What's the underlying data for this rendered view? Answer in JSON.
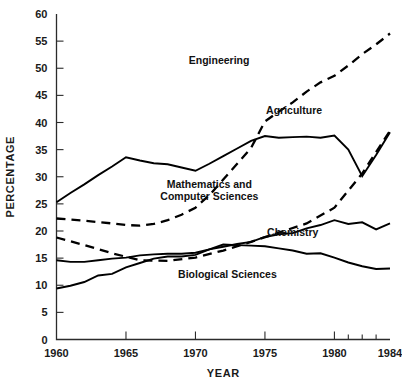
{
  "chart_data": {
    "type": "line",
    "title": "",
    "subtitle": "",
    "xlabel": "YEAR",
    "ylabel": "PERCENTAGE",
    "xlim": [
      1960,
      1984
    ],
    "ylim": [
      0,
      60
    ],
    "ytick_step": 5,
    "grid": false,
    "legend_position": "inline-labels",
    "y_ticks": [
      0,
      5,
      10,
      15,
      20,
      25,
      30,
      35,
      40,
      45,
      50,
      55,
      60
    ],
    "y_tick_labels": [
      "0",
      "5",
      "10",
      "15",
      "20",
      "25",
      "30",
      "35",
      "40",
      "45",
      "50",
      "55",
      "60"
    ],
    "x_ticks_major": [
      1960,
      1965,
      1970,
      1975,
      1980,
      1984
    ],
    "x_tick_labels": [
      "1960",
      "1965",
      "1970",
      "1975",
      "1980",
      "1984"
    ],
    "x_ticks_minor": [
      1981,
      1982,
      1983
    ],
    "series": [
      {
        "name": "Agriculture",
        "style": "solid",
        "color": "#000000",
        "label_x": 1977.1,
        "label_y": 41.5,
        "x": [
          1960,
          1961,
          1962,
          1963,
          1964,
          1965,
          1966,
          1967,
          1968,
          1969,
          1970,
          1971,
          1972,
          1973,
          1974,
          1975,
          1976,
          1977,
          1978,
          1979,
          1980,
          1981,
          1982,
          1983,
          1984
        ],
        "values": [
          25.3,
          27.0,
          28.6,
          30.3,
          31.9,
          33.6,
          33.0,
          32.5,
          32.3,
          31.7,
          31.1,
          32.4,
          33.8,
          35.2,
          36.6,
          37.5,
          37.2,
          37.3,
          37.4,
          37.2,
          37.6,
          35.0,
          30.1,
          34.0,
          38.2
        ]
      },
      {
        "name": "Engineering",
        "style": "dashed",
        "color": "#000000",
        "label_x": 1971.7,
        "label_y": 50.8,
        "x": [
          1960,
          1962,
          1964,
          1965,
          1966,
          1967,
          1968,
          1969,
          1970,
          1971,
          1972,
          1973,
          1974,
          1975,
          1976,
          1977,
          1978,
          1979,
          1980,
          1981,
          1982,
          1983,
          1984
        ],
        "values": [
          22.3,
          21.9,
          21.4,
          21.1,
          21.0,
          21.3,
          22.0,
          23.0,
          24.3,
          26.6,
          29.5,
          32.4,
          35.3,
          40.2,
          42.0,
          43.7,
          45.7,
          47.4,
          48.6,
          50.5,
          52.6,
          54.4,
          56.4
        ]
      },
      {
        "name": "Mathematics and Computer Sciences",
        "style": "dashed",
        "color": "#000000",
        "label_x": 1971.0,
        "label_y": 28.0,
        "label_line_2": "Computer Sciences",
        "x": [
          1960,
          1962,
          1964,
          1966,
          1968,
          1970,
          1972,
          1974,
          1976,
          1978,
          1980,
          1982,
          1984
        ],
        "values": [
          18.8,
          17.4,
          15.9,
          14.6,
          14.5,
          15.1,
          16.4,
          18.0,
          19.7,
          21.4,
          24.3,
          30.6,
          38.5
        ]
      },
      {
        "name": "Chemistry",
        "style": "solid",
        "color": "#000000",
        "label_x": 1977.0,
        "label_y": 19.0,
        "x": [
          1960,
          1961,
          1962,
          1963,
          1964,
          1965,
          1966,
          1967,
          1968,
          1969,
          1970,
          1971,
          1972,
          1973,
          1974,
          1975,
          1976,
          1977,
          1978,
          1979,
          1980,
          1981,
          1982,
          1983,
          1984
        ],
        "values": [
          14.6,
          14.3,
          14.3,
          14.6,
          14.9,
          15.1,
          15.5,
          15.7,
          15.8,
          15.8,
          16.0,
          16.6,
          17.1,
          17.6,
          18.0,
          18.9,
          19.4,
          19.6,
          20.5,
          21.1,
          22.0,
          21.3,
          21.6,
          20.3,
          21.4
        ]
      },
      {
        "name": "Biological Sciences",
        "style": "solid",
        "color": "#000000",
        "label_x": 1972.3,
        "label_y": 11.3,
        "x": [
          1960,
          1961,
          1962,
          1963,
          1964,
          1965,
          1966,
          1967,
          1968,
          1969,
          1970,
          1971,
          1972,
          1973,
          1974,
          1975,
          1976,
          1977,
          1978,
          1979,
          1980,
          1981,
          1982,
          1983,
          1984
        ],
        "values": [
          9.4,
          9.9,
          10.6,
          11.8,
          12.1,
          13.3,
          14.1,
          14.9,
          15.3,
          15.3,
          15.6,
          16.6,
          17.5,
          17.4,
          17.3,
          17.2,
          16.8,
          16.4,
          15.8,
          15.9,
          15.1,
          14.2,
          13.5,
          13.0,
          13.1
        ]
      }
    ]
  },
  "style": {
    "axis_color": "#2b2b2b",
    "line_color": "#000000",
    "background": "#ffffff"
  }
}
